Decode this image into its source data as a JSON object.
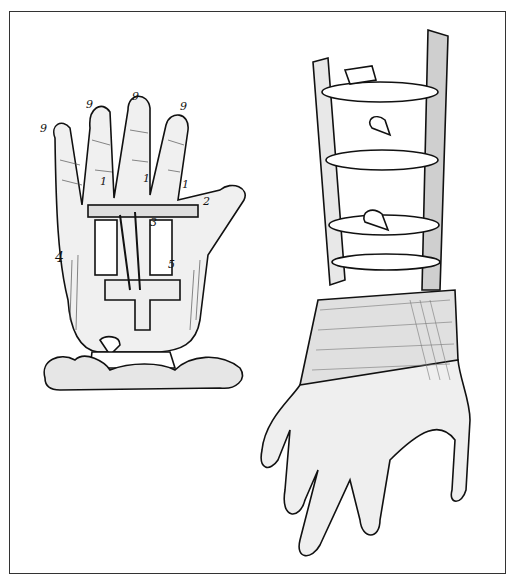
{
  "figure": {
    "left_illustration": "mechanical-hand-engraving",
    "right_illustration": "armored-prosthetic-arm-engraving",
    "labels": {
      "fingertip": "9",
      "joint": "1",
      "pin": "2",
      "lever": "3",
      "rod": "4",
      "spring": "5"
    },
    "colors": {
      "ink": "#111111",
      "paper": "#ffffff",
      "frame": "#333333"
    }
  }
}
